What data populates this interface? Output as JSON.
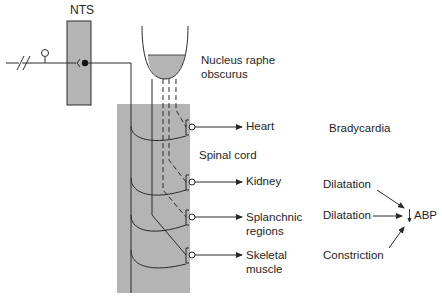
{
  "colors": {
    "stroke": "#2a2a2a",
    "gray_fill": "#b4b4b4",
    "background": "#ffffff"
  },
  "labels": {
    "nts": "NTS",
    "nucleus_line1": "Nucleus raphe",
    "nucleus_line2": "obscurus",
    "spinal_cord": "Spinal cord",
    "bradycardia": "Bradycardia"
  },
  "targets": [
    {
      "line1": "Heart",
      "line2": ""
    },
    {
      "line1": "Kidney",
      "line2": ""
    },
    {
      "line1": "Splanchnic",
      "line2": "regions"
    },
    {
      "line1": "Skeletal",
      "line2": "muscle"
    }
  ],
  "effects": [
    {
      "label": "Dilatation"
    },
    {
      "label": "Dilatation"
    },
    {
      "label": "Constriction"
    }
  ],
  "outcome": {
    "label": "ABP",
    "direction_icon": "down-arrow-icon"
  }
}
